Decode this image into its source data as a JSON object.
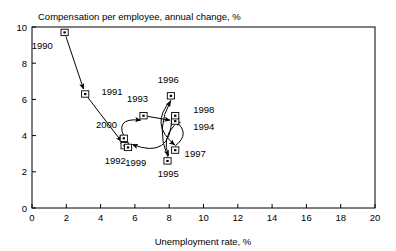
{
  "chart_data": {
    "type": "scatter",
    "title": "Compensation per employee, annual change, %",
    "xlabel": "Unemployment rate, %",
    "ylabel": "Compensation per employee, annual change, %",
    "xlim": [
      0,
      20
    ],
    "ylim": [
      0,
      10
    ],
    "grid": false,
    "legend": "none",
    "xticks": [
      "0",
      "2",
      "4",
      "6",
      "8",
      "10",
      "12",
      "14",
      "16",
      "18",
      "20"
    ],
    "yticks": [
      "0",
      "2",
      "4",
      "6",
      "8",
      "10"
    ],
    "xtick_values": [
      0,
      2,
      4,
      6,
      8,
      10,
      12,
      14,
      16,
      18,
      20
    ],
    "ytick_values": [
      0,
      2,
      4,
      6,
      8,
      10
    ],
    "connected": true,
    "connection_style": "curved-arrows-chronological",
    "points": [
      {
        "label": "1990",
        "x": 1.9,
        "y": 9.7,
        "lx": -1.3,
        "ly": -0.75,
        "anchor": "middle"
      },
      {
        "label": "1991",
        "x": 3.1,
        "y": 6.3,
        "lx": 0.95,
        "ly": 0.12,
        "anchor": "start"
      },
      {
        "label": "1992",
        "x": 5.4,
        "y": 3.45,
        "lx": -0.55,
        "ly": -0.85,
        "anchor": "middle"
      },
      {
        "label": "1993",
        "x": 6.5,
        "y": 5.1,
        "lx": -0.35,
        "ly": 0.95,
        "anchor": "middle"
      },
      {
        "label": "1994",
        "x": 8.35,
        "y": 4.8,
        "lx": 1.05,
        "ly": -0.28,
        "anchor": "start"
      },
      {
        "label": "1995",
        "x": 7.9,
        "y": 2.6,
        "lx": 0.05,
        "ly": -0.72,
        "anchor": "middle"
      },
      {
        "label": "1996",
        "x": 8.1,
        "y": 6.2,
        "lx": -0.15,
        "ly": 0.92,
        "anchor": "middle"
      },
      {
        "label": "1997",
        "x": 8.35,
        "y": 3.2,
        "lx": 0.55,
        "ly": -0.18,
        "anchor": "start"
      },
      {
        "label": "1998",
        "x": 8.35,
        "y": 5.1,
        "lx": 1.05,
        "ly": 0.35,
        "anchor": "start"
      },
      {
        "label": "1999",
        "x": 5.6,
        "y": 3.35,
        "lx": 0.45,
        "ly": -0.85,
        "anchor": "middle"
      },
      {
        "label": "2000",
        "x": 5.35,
        "y": 3.85,
        "lx": -1.0,
        "ly": 0.78,
        "anchor": "middle"
      }
    ]
  },
  "colors": {
    "axis": "#000000",
    "text": "#000000",
    "background": "#ffffff",
    "marker_fill": "#ffffff",
    "marker_stroke": "#000000"
  }
}
